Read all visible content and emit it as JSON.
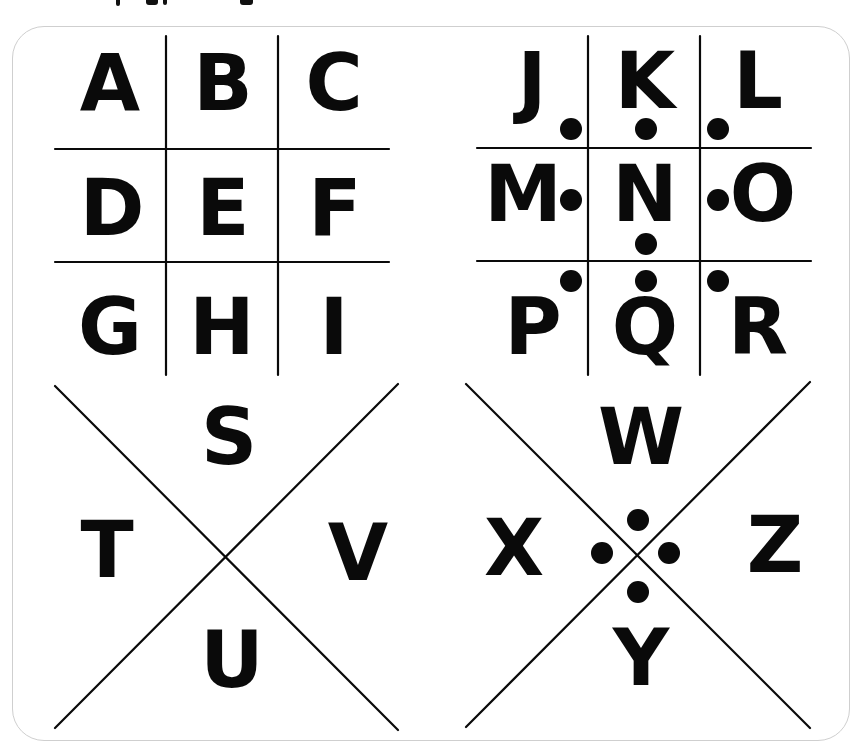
{
  "diagram": {
    "title_visible": "",
    "frame": {
      "border_color": "#cfcfcf",
      "background": "#ffffff"
    },
    "ink_color": "#0a0a0a",
    "grids": [
      {
        "id": "grid-a-i",
        "type": "tic-tac-toe",
        "dotted": false,
        "vertical_lines": [
          {
            "x": 166,
            "y1": 36,
            "y2": 375
          },
          {
            "x": 278,
            "y1": 36,
            "y2": 375
          }
        ],
        "horizontal_lines": [
          {
            "y": 149,
            "x1": 55,
            "x2": 389
          },
          {
            "y": 262,
            "x1": 55,
            "x2": 389
          }
        ],
        "letters": [
          {
            "char": "A",
            "x": 110,
            "y": 83
          },
          {
            "char": "B",
            "x": 223,
            "y": 83
          },
          {
            "char": "C",
            "x": 334,
            "y": 83
          },
          {
            "char": "D",
            "x": 112,
            "y": 208
          },
          {
            "char": "E",
            "x": 223,
            "y": 208
          },
          {
            "char": "F",
            "x": 335,
            "y": 208
          },
          {
            "char": "G",
            "x": 110,
            "y": 327
          },
          {
            "char": "H",
            "x": 222,
            "y": 327
          },
          {
            "char": "I",
            "x": 334,
            "y": 327
          }
        ],
        "dots": []
      },
      {
        "id": "grid-j-r",
        "type": "tic-tac-toe",
        "dotted": true,
        "vertical_lines": [
          {
            "x": 588,
            "y1": 36,
            "y2": 375
          },
          {
            "x": 700,
            "y1": 36,
            "y2": 375
          }
        ],
        "horizontal_lines": [
          {
            "y": 148,
            "x1": 477,
            "x2": 811
          },
          {
            "y": 261,
            "x1": 477,
            "x2": 811
          }
        ],
        "letters": [
          {
            "char": "J",
            "x": 532,
            "y": 81
          },
          {
            "char": "K",
            "x": 645,
            "y": 81
          },
          {
            "char": "L",
            "x": 758,
            "y": 81
          },
          {
            "char": "M",
            "x": 523,
            "y": 194
          },
          {
            "char": "N",
            "x": 645,
            "y": 194
          },
          {
            "char": "O",
            "x": 763,
            "y": 194
          },
          {
            "char": "P",
            "x": 533,
            "y": 327
          },
          {
            "char": "Q",
            "x": 645,
            "y": 327
          },
          {
            "char": "R",
            "x": 758,
            "y": 327
          }
        ],
        "dots": [
          {
            "for": "J",
            "x": 571,
            "y": 129
          },
          {
            "for": "K",
            "x": 646,
            "y": 129
          },
          {
            "for": "L",
            "x": 718,
            "y": 129
          },
          {
            "for": "M",
            "x": 571,
            "y": 200
          },
          {
            "for": "N",
            "x": 646,
            "y": 244
          },
          {
            "for": "O",
            "x": 718,
            "y": 200
          },
          {
            "for": "P",
            "x": 571,
            "y": 281
          },
          {
            "for": "Q",
            "x": 646,
            "y": 281
          },
          {
            "for": "R",
            "x": 718,
            "y": 281
          }
        ]
      },
      {
        "id": "x-s-v",
        "type": "x-shape",
        "dotted": false,
        "diagonals": [
          {
            "x1": 55,
            "y1": 386,
            "x2": 398,
            "y2": 730
          },
          {
            "x1": 55,
            "y1": 728,
            "x2": 398,
            "y2": 384
          }
        ],
        "letters": [
          {
            "char": "S",
            "x": 229,
            "y": 437
          },
          {
            "char": "T",
            "x": 107,
            "y": 550
          },
          {
            "char": "V",
            "x": 358,
            "y": 553
          },
          {
            "char": "U",
            "x": 232,
            "y": 660
          }
        ],
        "dots": []
      },
      {
        "id": "x-w-z",
        "type": "x-shape",
        "dotted": true,
        "diagonals": [
          {
            "x1": 466,
            "y1": 384,
            "x2": 810,
            "y2": 728
          },
          {
            "x1": 466,
            "y1": 727,
            "x2": 810,
            "y2": 382
          }
        ],
        "letters": [
          {
            "char": "W",
            "x": 641,
            "y": 437
          },
          {
            "char": "X",
            "x": 514,
            "y": 548
          },
          {
            "char": "Z",
            "x": 775,
            "y": 545
          },
          {
            "char": "Y",
            "x": 641,
            "y": 658
          }
        ],
        "dots": [
          {
            "for": "W",
            "x": 638,
            "y": 520
          },
          {
            "for": "X",
            "x": 602,
            "y": 553
          },
          {
            "for": "Z",
            "x": 669,
            "y": 553
          },
          {
            "for": "Y",
            "x": 638,
            "y": 592
          }
        ]
      }
    ]
  }
}
